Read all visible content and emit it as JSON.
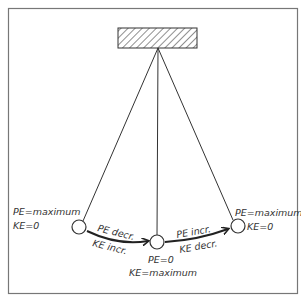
{
  "diagram": {
    "left": {
      "pe": "PE=maximum",
      "ke": "KE=0"
    },
    "middle": {
      "pe": "PE=0",
      "ke": "KE=maximum"
    },
    "right": {
      "pe": "PE=maximum",
      "ke": "KE=0"
    },
    "arrow_left": {
      "top": "PE decr.",
      "bottom": "KE incr."
    },
    "arrow_right": {
      "top": "PE incr.",
      "bottom": "KE decr."
    },
    "colors": {
      "line": "#333333",
      "frame": "#777777",
      "background": "#ffffff"
    }
  }
}
